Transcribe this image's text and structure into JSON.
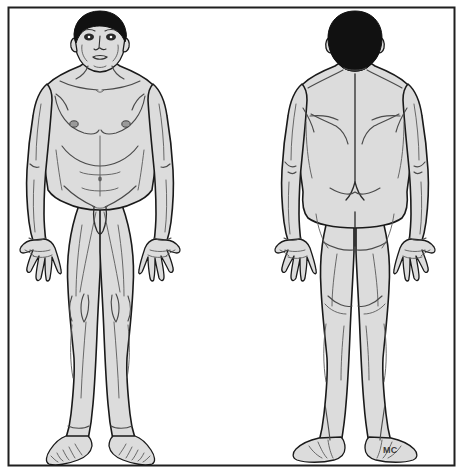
{
  "document": {
    "title": "Human Body Anatomical Reference Chart",
    "type": "line-art illustration",
    "subject": "adult male human figure",
    "views": [
      "anterior (front)",
      "posterior (back)"
    ],
    "background_color": "#ffffff",
    "skin_fill_color": "#dcdcdc",
    "hair_fill_color": "#111111",
    "outline_color": "#1a1a1a",
    "detail_line_color": "#4a4a4a",
    "border": {
      "color": "#1f1f1f",
      "width_px": 2,
      "x": 8,
      "y": 7,
      "width": 447,
      "height": 459
    }
  },
  "signature": {
    "label": "MC",
    "x": 383,
    "y": 451,
    "description": "artist initials signature"
  },
  "figures": [
    {
      "id": "anterior-figure",
      "name": "Anterior View Male Figure",
      "view": "anterior",
      "center_x": 100,
      "regions": [
        "head",
        "face",
        "eyes",
        "nose",
        "mouth",
        "ears",
        "neck",
        "clavicle",
        "shoulders",
        "pectorals",
        "nipples",
        "ribcage",
        "abdomen",
        "navel",
        "inguinal-crease",
        "genitals",
        "arms",
        "elbows",
        "forearms",
        "wrists",
        "hands",
        "fingers",
        "thighs",
        "knees",
        "patella",
        "shins",
        "calves",
        "ankles",
        "feet",
        "toes"
      ]
    },
    {
      "id": "posterior-figure",
      "name": "Posterior View Male Figure",
      "view": "posterior",
      "center_x": 355,
      "regions": [
        "occiput",
        "hair",
        "ears",
        "nape",
        "trapezius",
        "scapulae",
        "spine",
        "latissimus-dorsi",
        "lumbar-region",
        "gluteal-region",
        "gluteal-cleft",
        "arms",
        "elbows",
        "forearms",
        "wrists",
        "hands",
        "fingers",
        "hamstrings",
        "popliteal-fossa",
        "calves",
        "achilles",
        "heels"
      ]
    }
  ],
  "accent_colors": {
    "skin": "#dcdcdc",
    "skin_shadow": "#cfcfcf",
    "hair": "#111111",
    "outline": "#1a1a1a",
    "detail": "#555555",
    "frame": "#1f1f1f"
  }
}
